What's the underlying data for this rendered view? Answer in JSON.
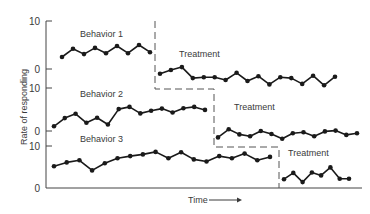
{
  "chart_data": {
    "type": "line",
    "title": "",
    "ylabel": "Rate of responding",
    "xlabel": "Time",
    "xlabel_arrow": "→",
    "grid": false,
    "panels": [
      {
        "name": "Behavior 1",
        "label": "Behavior 1",
        "treatment_label": "Treatment",
        "yticks": [
          "10",
          "0"
        ],
        "ylim": [
          0,
          10
        ],
        "baseline": [
          2.5,
          4.2,
          3.1,
          4.4,
          3.3,
          4.8,
          3.3,
          5.0,
          3.5
        ],
        "treatment": [
          -1.0,
          -0.2,
          0.4,
          -1.9,
          -1.7,
          -1.7,
          -2.3,
          -0.8,
          -2.5,
          -1.5,
          -3.2,
          -1.7,
          -1.9,
          -3.1,
          -1.4,
          -3.4,
          -1.6
        ]
      },
      {
        "name": "Behavior 2",
        "label": "Behavior 2",
        "treatment_label": "Treatment",
        "yticks": [
          "10",
          "0"
        ],
        "ylim": [
          0,
          10
        ],
        "baseline": [
          1.1,
          3.0,
          4.0,
          1.9,
          3.1,
          1.5,
          5.1,
          5.6,
          4.1,
          4.7,
          5.2,
          4.3,
          5.3,
          5.6,
          4.9
        ],
        "treatment": [
          -1.5,
          0.4,
          -0.8,
          -1.2,
          0.0,
          -0.7,
          -1.8,
          -0.5,
          -0.3,
          -1.2,
          -0.1,
          0.1,
          -0.9,
          -0.5
        ]
      },
      {
        "name": "Behavior 3",
        "label": "Behavior 3",
        "treatment_label": "Treatment",
        "yticks": [
          "10",
          "0"
        ],
        "ylim": [
          0,
          10
        ],
        "baseline": [
          5.2,
          6.1,
          6.6,
          4.2,
          5.9,
          7.1,
          7.6,
          8.0,
          8.6,
          7.1,
          8.5,
          6.8,
          6.3,
          7.6,
          7.1,
          8.2,
          6.6,
          7.4
        ],
        "treatment": [
          2.1,
          3.6,
          1.4,
          3.7,
          3.0,
          4.9,
          2.2,
          2.2
        ]
      }
    ]
  }
}
